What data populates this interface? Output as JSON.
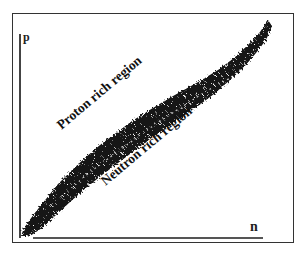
{
  "figure": {
    "y_axis_label": "p",
    "x_axis_label": "n",
    "regions": {
      "upper": "Proton rich region",
      "lower": "Neutron rich region"
    },
    "band_color": "#111111",
    "frame_color": "#333333"
  }
}
